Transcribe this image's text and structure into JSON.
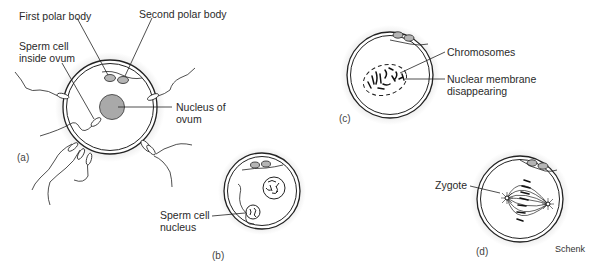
{
  "figure": {
    "credit": "Schenk",
    "panels": [
      {
        "id": "a",
        "label": "(a)",
        "annotations": [
          "First polar body",
          "Second polar body",
          "Sperm cell\ninside ovum",
          "Nucleus of\novum"
        ]
      },
      {
        "id": "b",
        "label": "(b)",
        "annotations": [
          "Sperm cell\nnucleus"
        ]
      },
      {
        "id": "c",
        "label": "(c)",
        "annotations": [
          "Chromosomes",
          "Nuclear membrane\ndisappearing"
        ]
      },
      {
        "id": "d",
        "label": "(d)",
        "annotations": [
          "Zygote"
        ]
      }
    ]
  },
  "colors": {
    "line": "#222222",
    "halo": "#ececec",
    "polar_body": "#b5b5b5",
    "nucleus": "#a9a9a9"
  }
}
